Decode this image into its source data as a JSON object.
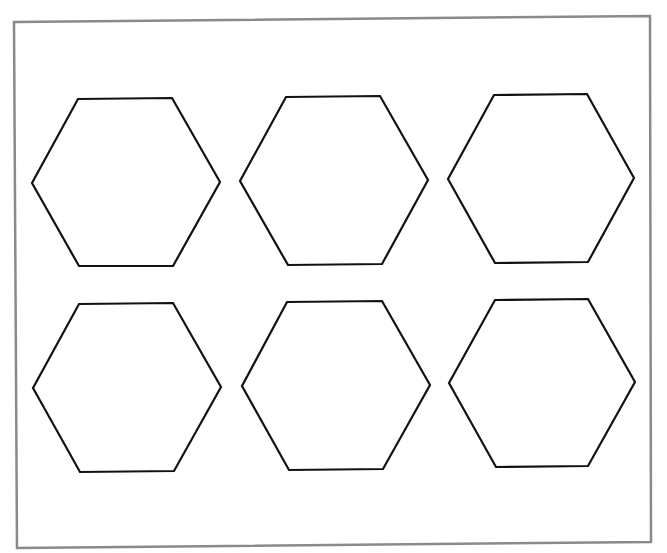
{
  "sheet": {
    "background": "#ffffff",
    "frame": {
      "stroke": "#8a8a8a",
      "stroke_width": 2.5,
      "corners": [
        [
          14,
          22
        ],
        [
          650,
          16
        ],
        [
          651,
          542
        ],
        [
          17,
          548
        ]
      ]
    }
  },
  "shape_style": {
    "stroke": "#111111",
    "stroke_width": 2.2,
    "fill": "none"
  },
  "shapes": [
    {
      "type": "hexagon",
      "row": 1,
      "col": 1,
      "points": [
        [
          78,
          99
        ],
        [
          172,
          98
        ],
        [
          220,
          182
        ],
        [
          173,
          266
        ],
        [
          79,
          266
        ],
        [
          32,
          183
        ]
      ]
    },
    {
      "type": "hexagon",
      "row": 1,
      "col": 2,
      "points": [
        [
          286,
          97
        ],
        [
          380,
          96
        ],
        [
          428,
          180
        ],
        [
          382,
          264
        ],
        [
          288,
          265
        ],
        [
          240,
          181
        ]
      ]
    },
    {
      "type": "hexagon",
      "row": 1,
      "col": 3,
      "points": [
        [
          494,
          95
        ],
        [
          587,
          94
        ],
        [
          634,
          178
        ],
        [
          588,
          262
        ],
        [
          495,
          263
        ],
        [
          448,
          179
        ]
      ]
    },
    {
      "type": "hexagon",
      "row": 2,
      "col": 1,
      "points": [
        [
          79,
          304
        ],
        [
          173,
          303
        ],
        [
          221,
          387
        ],
        [
          174,
          471
        ],
        [
          80,
          472
        ],
        [
          33,
          388
        ]
      ]
    },
    {
      "type": "hexagon",
      "row": 2,
      "col": 2,
      "points": [
        [
          287,
          302
        ],
        [
          382,
          301
        ],
        [
          430,
          385
        ],
        [
          383,
          469
        ],
        [
          289,
          470
        ],
        [
          242,
          386
        ]
      ]
    },
    {
      "type": "hexagon",
      "row": 2,
      "col": 3,
      "points": [
        [
          495,
          300
        ],
        [
          588,
          299
        ],
        [
          635,
          382
        ],
        [
          588,
          466
        ],
        [
          496,
          467
        ],
        [
          449,
          383
        ]
      ]
    }
  ]
}
